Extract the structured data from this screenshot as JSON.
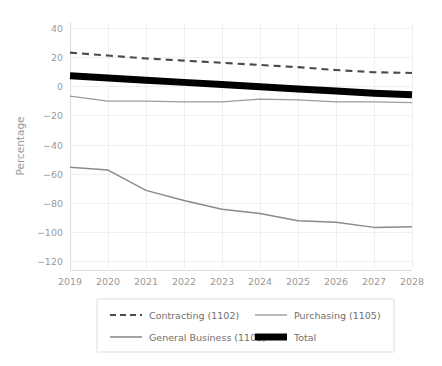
{
  "chart_data": {
    "type": "line",
    "title": "",
    "xlabel": "",
    "ylabel": "Percentage",
    "x": [
      2019,
      2020,
      2021,
      2022,
      2023,
      2024,
      2025,
      2026,
      2027,
      2028
    ],
    "categories": [
      "2019",
      "2020",
      "2021",
      "2022",
      "2023",
      "2024",
      "2025",
      "2026",
      "2027",
      "2028"
    ],
    "xtick_labels": [
      "2019",
      "2020",
      "2021",
      "2022",
      "2023",
      "2024",
      "2025",
      "2026",
      "2027",
      "2028"
    ],
    "ytick_labels": [
      "40",
      "20",
      "0",
      "−20",
      "−40",
      "−60",
      "−80",
      "−100",
      "−120"
    ],
    "yticks": [
      40,
      20,
      0,
      -20,
      -40,
      -60,
      -80,
      -100,
      -120
    ],
    "ylim": [
      -120,
      45
    ],
    "xlim": [
      2019,
      2028
    ],
    "grid": true,
    "legend_position": "bottom",
    "series": [
      {
        "name": "Contracting (1102)",
        "style": "dashed",
        "color": "#4a4a4a",
        "width": 2.1,
        "values": [
          23,
          21,
          19,
          17.5,
          16,
          14.5,
          13,
          11,
          9.5,
          9
        ]
      },
      {
        "name": "Purchasing (1105)",
        "style": "solid",
        "color": "#9b9b9b",
        "width": 1.3,
        "values": [
          -7,
          -10.5,
          -10.5,
          -11,
          -11,
          -9,
          -9.5,
          -11,
          -11,
          -11.5
        ]
      },
      {
        "name": "General Business (1101)",
        "style": "solid",
        "color": "#8a8a8a",
        "width": 1.5,
        "values": [
          -56,
          -58,
          -72,
          -79,
          -85,
          -88,
          -93,
          -94,
          -97.5,
          -97
        ]
      },
      {
        "name": "Total",
        "style": "solid",
        "color": "#000000",
        "width": 7,
        "values": [
          7,
          5.5,
          4,
          2.5,
          1,
          -0.5,
          -2,
          -3.5,
          -5,
          -6
        ]
      }
    ]
  },
  "legend": {
    "entries": [
      {
        "label": "Contracting (1102)",
        "swatch": "dashed-gray"
      },
      {
        "label": "Purchasing (1105)",
        "swatch": "solid-gray"
      },
      {
        "label": "General Business (1101)",
        "swatch": "solid-gray"
      },
      {
        "label": "Total",
        "swatch": "thick-black"
      }
    ]
  },
  "axes": {
    "y_axis_title": "Percentage"
  }
}
